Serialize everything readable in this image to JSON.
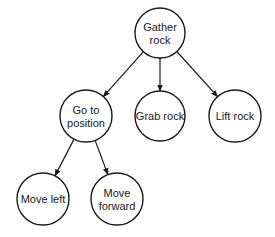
{
  "diagram": {
    "type": "tree",
    "nodes": [
      {
        "id": "gather",
        "lines": [
          "Gather",
          "rock"
        ],
        "cx": 160,
        "cy": 33,
        "r": 25
      },
      {
        "id": "goto",
        "lines": [
          "Go to",
          "position"
        ],
        "cx": 86,
        "cy": 116,
        "r": 26
      },
      {
        "id": "grab",
        "lines": [
          "Grab rock"
        ],
        "cx": 160,
        "cy": 116,
        "r": 25
      },
      {
        "id": "lift",
        "lines": [
          "Lift rock"
        ],
        "cx": 235,
        "cy": 116,
        "r": 26
      },
      {
        "id": "left",
        "lines": [
          "Move left"
        ],
        "cx": 43,
        "cy": 199,
        "r": 26
      },
      {
        "id": "forward",
        "lines": [
          "Move",
          "forward"
        ],
        "cx": 117,
        "cy": 199,
        "r": 26
      }
    ],
    "edges": [
      {
        "from": "gather",
        "to": "goto"
      },
      {
        "from": "gather",
        "to": "grab"
      },
      {
        "from": "gather",
        "to": "lift"
      },
      {
        "from": "goto",
        "to": "left"
      },
      {
        "from": "goto",
        "to": "forward"
      }
    ],
    "stroke_color": "#1a1a1a"
  }
}
